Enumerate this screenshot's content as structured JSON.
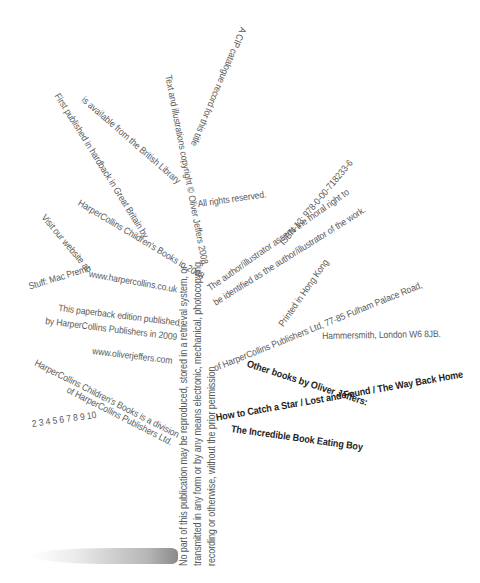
{
  "page": {
    "cip_line1": "A CIP catalogue record for this title",
    "cip_line2": "is available from the British Library",
    "copyright": "Text and illustrations copyright © Oliver Jeffers 2008",
    "rights": "All rights reserved.",
    "isbn": "ISBN-13: 978-0-00-718233-6",
    "first_published_1": "First published in hardback in Great Britain by",
    "first_published_2": "HarperCollins Children's Books in 2008",
    "moral_right_1": "The author/illustrator asserts the moral right to",
    "moral_right_2": "be identified as the author/illustrator of the work.",
    "visit": "Visit our website at:",
    "stuff": "Stuff: Mac Premo",
    "website1": "www.harpercollins.co.uk",
    "printed": "Printed in Hong Kong",
    "paperback_1": "This paperback edition published",
    "paperback_2": "by HarperCollins Publishers in 2009",
    "address_1": "of HarperCollins Publishers Ltd, 77-85 Fulham Palace Road,",
    "address_2": "Hammersmith, London W6 8JB.",
    "website2": "www.oliverjeffers.com",
    "division_1": "HarperCollins Children's Books is a division",
    "division_2": "of HarperCollins Publishers Ltd.",
    "print_line": "2 3 4 5 6 7 8 9 10",
    "trunk_1": "No part of this publication may be reproduced, stored in a retrieval system, or",
    "trunk_2": "transmitted in any form or by any means electronic, mechanical, photocopying,",
    "trunk_3": "recording or otherwise, without the prior permission",
    "other_books_heading": "Other books by Oliver Jeffers:",
    "other_books_1": "How to Catch a Star / Lost and Found / The Way Back Home",
    "other_books_2": "The Incredible Book Eating Boy"
  }
}
